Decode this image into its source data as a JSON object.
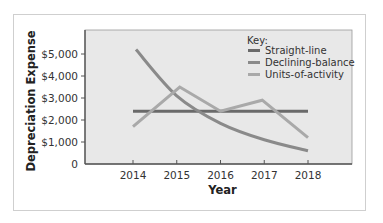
{
  "chart_data": {
    "type": "line",
    "title": "",
    "xlabel": "Year",
    "ylabel": "Depreciation Expense",
    "categories": [
      "2014",
      "2015",
      "2016",
      "2017",
      "2018"
    ],
    "y_ticks": [
      "0",
      "$1,000",
      "$2,000",
      "$3,000",
      "$4,000",
      "$5,000"
    ],
    "ylim": [
      0,
      6000
    ],
    "grid": false,
    "legend_title": "Key:",
    "legend_position": "top-right",
    "series": [
      {
        "name": "Straight-line",
        "values": [
          2400,
          2400,
          2400,
          2400,
          2400
        ],
        "color": "#6a6a6a"
      },
      {
        "name": "Declining-balance",
        "values": [
          5200,
          3100,
          1850,
          1100,
          600
        ],
        "color": "#8a8a8a"
      },
      {
        "name": "Units-of-activity",
        "values": [
          1700,
          3500,
          2400,
          2900,
          1200
        ],
        "color": "#a9a9a9"
      }
    ]
  },
  "colors": {
    "plot_background": "#e8e8e8",
    "axis": "#555555"
  }
}
